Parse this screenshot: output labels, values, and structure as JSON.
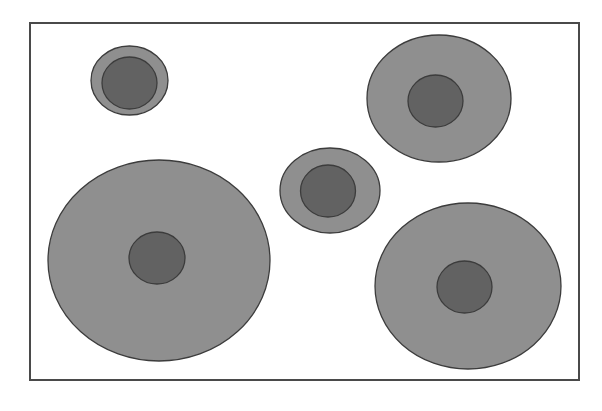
{
  "diagram": {
    "colors": {
      "background": "#ffffff",
      "frame_stroke": "#4a4a4a",
      "outer_fill": "#8f8f8f",
      "inner_fill": "#626262",
      "shape_stroke": "#3c3c3c"
    },
    "frame": {
      "x": 30,
      "y": 23,
      "width": 549,
      "height": 357
    },
    "cells": [
      {
        "id": "cell-top-left",
        "outer": {
          "cx": 129.5,
          "cy": 80.5,
          "rx": 38.5,
          "ry": 34.5
        },
        "inner": {
          "cx": 129.5,
          "cy": 83,
          "rx": 27.5,
          "ry": 26
        }
      },
      {
        "id": "cell-top-right",
        "outer": {
          "cx": 439,
          "cy": 98.5,
          "rx": 72,
          "ry": 63.5
        },
        "inner": {
          "cx": 435.5,
          "cy": 101,
          "rx": 27.5,
          "ry": 26
        }
      },
      {
        "id": "cell-middle",
        "outer": {
          "cx": 330,
          "cy": 190.5,
          "rx": 50,
          "ry": 42.5
        },
        "inner": {
          "cx": 328,
          "cy": 191,
          "rx": 27.5,
          "ry": 26
        }
      },
      {
        "id": "cell-bottom-left",
        "outer": {
          "cx": 159,
          "cy": 260.5,
          "rx": 111,
          "ry": 100.5
        },
        "inner": {
          "cx": 157,
          "cy": 258,
          "rx": 28,
          "ry": 26
        }
      },
      {
        "id": "cell-bottom-right",
        "outer": {
          "cx": 468,
          "cy": 286,
          "rx": 93,
          "ry": 83
        },
        "inner": {
          "cx": 464.5,
          "cy": 287,
          "rx": 27.5,
          "ry": 26
        }
      }
    ]
  }
}
